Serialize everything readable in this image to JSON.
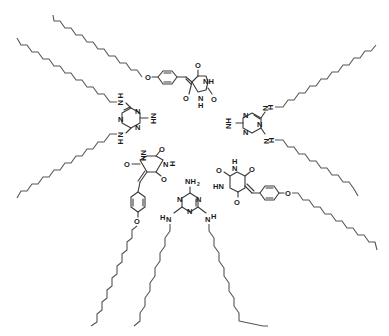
{
  "diagram": {
    "type": "chemical-structure",
    "colors": {
      "background": "#ffffff",
      "bonds": "#3a3a3a",
      "chains": "#555555",
      "text": "#1a1a1a"
    },
    "atoms": {
      "N": "N",
      "NH": "NH",
      "HN": "HN",
      "H": "H",
      "O": "O",
      "NH2": "NH",
      "sub2": "2"
    },
    "units": [
      {
        "id": "barbiturate-top",
        "kind": "barbiturate",
        "substituent": "4-dodecyloxybenzylidene"
      },
      {
        "id": "melamine-left",
        "kind": "melamine",
        "substituent": "N,N'-didodecyl"
      },
      {
        "id": "melamine-right",
        "kind": "melamine",
        "substituent": "N,N'-didodecyl"
      },
      {
        "id": "barbiturate-lower-left",
        "kind": "barbiturate",
        "substituent": "4-dodecyloxybenzylidene"
      },
      {
        "id": "barbiturate-lower-right",
        "kind": "barbiturate",
        "substituent": "4-dodecyloxybenzylidene"
      },
      {
        "id": "melamine-bottom",
        "kind": "melamine",
        "substituent": "N,N'-didodecyl"
      }
    ]
  }
}
